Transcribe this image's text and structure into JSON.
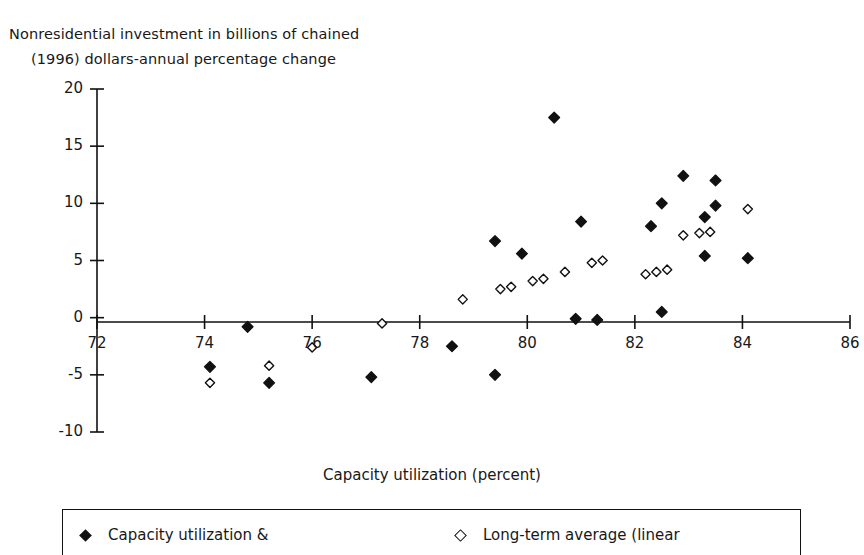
{
  "chart_data": {
    "type": "scatter",
    "title": "",
    "ylabel_line1": "Nonresidential investment in billions of chained",
    "ylabel_line2": "(1996) dollars-annual percentage change",
    "xlabel": "Capacity utilization (percent)",
    "xlim": [
      72,
      86
    ],
    "ylim": [
      -10,
      20
    ],
    "xticks": [
      72,
      74,
      76,
      78,
      80,
      82,
      84,
      86
    ],
    "yticks": [
      20,
      15,
      10,
      5,
      0,
      -5,
      -10
    ],
    "xtick_labels": [
      "72",
      "74",
      "76",
      "78",
      "80",
      "82",
      "84",
      "86"
    ],
    "ytick_labels": [
      "20",
      "15",
      "10",
      "5",
      "0",
      "-5",
      "-10"
    ],
    "grid": false,
    "legend_position": "bottom",
    "series": [
      {
        "name": "Capacity utilization &",
        "marker": "filled-diamond",
        "color": "#111111",
        "points": [
          [
            74.8,
            -0.8
          ],
          [
            74.1,
            -4.3
          ],
          [
            75.2,
            -5.7
          ],
          [
            77.1,
            -5.2
          ],
          [
            78.6,
            -2.5
          ],
          [
            79.4,
            -5.0
          ],
          [
            79.4,
            6.7
          ],
          [
            79.9,
            5.6
          ],
          [
            80.5,
            17.5
          ],
          [
            81.0,
            8.4
          ],
          [
            80.9,
            -0.1
          ],
          [
            81.3,
            -0.2
          ],
          [
            82.3,
            8.0
          ],
          [
            82.5,
            10.0
          ],
          [
            82.5,
            0.5
          ],
          [
            82.9,
            12.4
          ],
          [
            83.3,
            8.8
          ],
          [
            83.5,
            9.8
          ],
          [
            83.5,
            12.0
          ],
          [
            83.3,
            5.4
          ],
          [
            84.1,
            5.2
          ]
        ]
      },
      {
        "name": "Long-term average (linear",
        "marker": "open-diamond",
        "color": "#111111",
        "points": [
          [
            74.1,
            -5.7
          ],
          [
            75.2,
            -4.2
          ],
          [
            76.0,
            -2.6
          ],
          [
            77.3,
            -0.5
          ],
          [
            78.8,
            1.6
          ],
          [
            79.5,
            2.5
          ],
          [
            79.7,
            2.7
          ],
          [
            80.1,
            3.2
          ],
          [
            80.3,
            3.4
          ],
          [
            80.7,
            4.0
          ],
          [
            81.2,
            4.8
          ],
          [
            81.4,
            5.0
          ],
          [
            82.2,
            3.8
          ],
          [
            82.4,
            4.0
          ],
          [
            82.6,
            4.2
          ],
          [
            82.9,
            7.2
          ],
          [
            83.2,
            7.4
          ],
          [
            83.4,
            7.5
          ],
          [
            84.1,
            9.5
          ]
        ]
      }
    ]
  },
  "legend": {
    "entries": [
      {
        "label": "Capacity utilization &",
        "marker": "filled-diamond"
      },
      {
        "label": "Long-term average (linear",
        "marker": "open-diamond"
      }
    ]
  },
  "colors": {
    "ink": "#111111",
    "background": "#ffffff"
  }
}
